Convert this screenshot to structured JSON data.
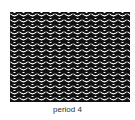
{
  "figure": {
    "caption": "period 4",
    "pattern": {
      "foreground": "#111111",
      "background": "#ffffff",
      "tile_width": 9,
      "tile_height": 6
    }
  }
}
